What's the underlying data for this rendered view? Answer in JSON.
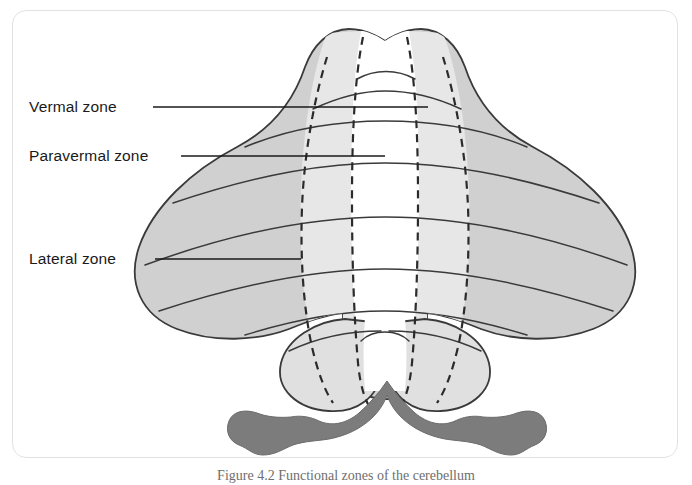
{
  "figure": {
    "title": "Functional zones of the cerebellum",
    "view": "dorsal view",
    "caption_partial": "Figure 4.2 Functional zones of the cerebellum"
  },
  "labels": [
    {
      "id": "vermal",
      "text": "Vermal zone",
      "x": 28,
      "y": 101,
      "leader_x1": 140,
      "leader_x2": 415,
      "leader_y": 96
    },
    {
      "id": "paravermal",
      "text": "Paravermal zone",
      "x": 28,
      "y": 150,
      "leader_x1": 168,
      "leader_x2": 372,
      "leader_y": 145
    },
    {
      "id": "lateral",
      "text": "Lateral zone",
      "x": 28,
      "y": 253,
      "leader_x1": 142,
      "leader_x2": 288,
      "leader_y": 248
    }
  ],
  "zones": [
    {
      "name": "Vermal zone",
      "region": "midline vermis",
      "color": "#ffffff",
      "description": "Central white midline strip"
    },
    {
      "name": "Paravermal zone",
      "region": "intermediate hemisphere",
      "color": "#e7e7e7",
      "description": "Light grey band flanking the vermis"
    },
    {
      "name": "Lateral zone",
      "region": "lateral hemisphere",
      "color": "#d0d0d0",
      "description": "Darker grey broad lateral wings"
    }
  ],
  "structures": [
    {
      "name": "cerebellum",
      "shape": "heart-shaped dorsal outline with broad lateral wings"
    },
    {
      "name": "flocculonodular-lobes",
      "shape": "paired rounded lobes at inferior margin",
      "color": "#e0e0e0"
    },
    {
      "name": "brainstem",
      "shape": "dark grey M-shaped band with bulbous lateral ends",
      "color": "#7c7c7c"
    }
  ],
  "colors": {
    "vermal": "#ffffff",
    "paravermal": "#e7e7e7",
    "lateral": "#d0d0d0",
    "flocculonodular": "#e0e0e0",
    "brainstem": "#7c7c7c",
    "outline": "#3a3a3a",
    "dashed_boundary": "#2b2b2b",
    "frame": "#e2e2e2",
    "label_text": "#1a1a1a",
    "caption_text": "#6e6e6e",
    "background": "#ffffff"
  },
  "counts": {
    "zones": 3,
    "fissure_lines": 7,
    "dashed_boundaries": 4
  }
}
